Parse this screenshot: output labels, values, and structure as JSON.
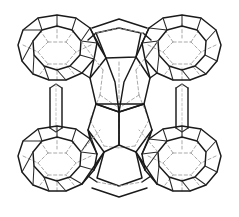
{
  "figure": {
    "kind": "crystal-framework-wireframe",
    "projection": "oblique perspective wireframe",
    "width_px": 239,
    "height_px": 217,
    "background_color": "#ffffff",
    "front_edge_color": "#1a1a1a",
    "hidden_edge_color": "#9a9a9a",
    "hidden_edge_style": "dashed",
    "caption": "",
    "title": "",
    "labels": []
  },
  "structure": {
    "cage_count": 5,
    "corner_cage_count": 4,
    "center_cage_count": 1,
    "cages": [
      {
        "id": "cage-top-left",
        "position": "top-left",
        "center_x": 57,
        "center_y": 52,
        "radius_x": 41,
        "radius_y": 37,
        "ring_vertices": 12,
        "type": "truncated-octahedron"
      },
      {
        "id": "cage-top-right",
        "position": "top-right",
        "center_x": 182,
        "center_y": 52,
        "radius_x": 41,
        "radius_y": 37,
        "ring_vertices": 12,
        "type": "truncated-octahedron"
      },
      {
        "id": "cage-bottom-left",
        "position": "bottom-left",
        "center_x": 57,
        "center_y": 163,
        "radius_x": 41,
        "radius_y": 37,
        "ring_vertices": 12,
        "type": "truncated-octahedron"
      },
      {
        "id": "cage-bottom-right",
        "position": "bottom-right",
        "center_x": 182,
        "center_y": 163,
        "radius_x": 41,
        "radius_y": 37,
        "ring_vertices": 12,
        "type": "truncated-octahedron"
      },
      {
        "id": "cage-center",
        "position": "center",
        "center_x": 119,
        "center_y": 108,
        "radius_x": 40,
        "radius_y": 46,
        "ring_vertices": 10,
        "type": "pentagonal-linking-cage"
      }
    ],
    "connectors": [
      {
        "id": "bridge-left-vertical",
        "orientation": "vertical",
        "from": "cage-top-left",
        "to": "cage-bottom-left",
        "type": "four-ring-prism",
        "x": 57,
        "y_start": 90,
        "y_end": 126
      },
      {
        "id": "bridge-right-vertical",
        "orientation": "vertical",
        "from": "cage-top-right",
        "to": "cage-bottom-right",
        "type": "four-ring-prism",
        "x": 182,
        "y_start": 90,
        "y_end": 126
      },
      {
        "id": "bridge-top-horizontal",
        "orientation": "horizontal",
        "from": "cage-top-left",
        "to": "cage-top-right",
        "type": "pentagonal-bridge",
        "y": 35,
        "x_start": 96,
        "x_end": 143
      },
      {
        "id": "bridge-bottom-horizontal",
        "orientation": "horizontal",
        "from": "cage-bottom-left",
        "to": "cage-bottom-right",
        "type": "pentagonal-bridge",
        "y": 181,
        "x_start": 96,
        "x_end": 143
      }
    ]
  }
}
